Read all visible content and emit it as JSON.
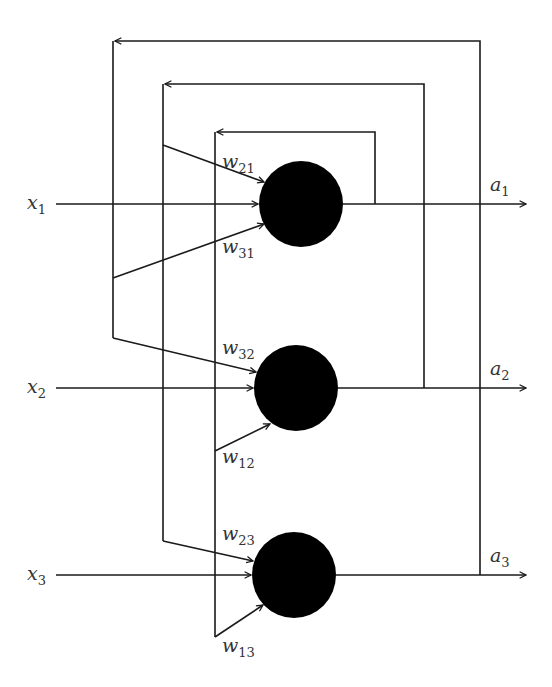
{
  "diagram": {
    "colors": {
      "wire": "#1a1a1a",
      "neuron": "#000000",
      "label": "#333333",
      "background": "#ffffff"
    },
    "inputs": [
      {
        "name": "x",
        "sub": "1"
      },
      {
        "name": "x",
        "sub": "2"
      },
      {
        "name": "x",
        "sub": "3"
      }
    ],
    "outputs": [
      {
        "name": "a",
        "sub": "1"
      },
      {
        "name": "a",
        "sub": "2"
      },
      {
        "name": "a",
        "sub": "3"
      }
    ],
    "weights": {
      "w21": {
        "name": "w",
        "sub": "21"
      },
      "w31": {
        "name": "w",
        "sub": "31"
      },
      "w32": {
        "name": "w",
        "sub": "32"
      },
      "w12": {
        "name": "w",
        "sub": "12"
      },
      "w23": {
        "name": "w",
        "sub": "23"
      },
      "w13": {
        "name": "w",
        "sub": "13"
      }
    },
    "neurons": [
      {
        "id": "neuron-1",
        "cx": 301,
        "cy": 204,
        "r": 42
      },
      {
        "id": "neuron-2",
        "cx": 296,
        "cy": 388,
        "r": 42
      },
      {
        "id": "neuron-3",
        "cx": 294,
        "cy": 575,
        "r": 42
      }
    ]
  }
}
